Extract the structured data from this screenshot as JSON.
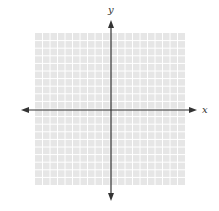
{
  "figure": {
    "type": "coordinate-plane",
    "x_axis_label": "x",
    "y_axis_label": "y",
    "grid_cells_x": 20,
    "grid_cells_y": 20,
    "colors": {
      "grid_fill": "#e6e6e6",
      "grid_lines": "#ffffff",
      "axis": "#333333"
    }
  }
}
